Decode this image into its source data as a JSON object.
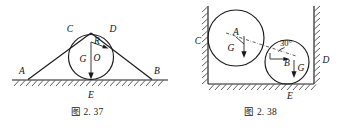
{
  "page": {
    "background_color": "#ffffff",
    "ink_color": "#1a1a1a",
    "width": 347,
    "height": 130
  },
  "figures": [
    {
      "id": "fig-2-37",
      "caption": "图 2. 37",
      "description": "Triangular wedge resting on hatched ground with a circle of radius R inscribed between the two inclined faces",
      "labels": {
        "a": "A",
        "b": "B",
        "c": "C",
        "d": "D",
        "e": "E",
        "o": "O",
        "r": "R",
        "g": "G"
      },
      "elements": {
        "ground_label": "E",
        "left_vertex_label": "A",
        "right_vertex_label": "B",
        "left_contact_label": "C",
        "right_contact_label": "D",
        "center_label": "O",
        "radius_label": "R",
        "weight_label": "G"
      }
    },
    {
      "id": "fig-2-38",
      "caption": "图 2. 38",
      "description": "Two circles A and B wedged between two vertical hatched walls and a hatched floor; the line of centers makes 30 degrees with the horizontal",
      "labels": {
        "a": "A",
        "b": "B",
        "c": "C",
        "d": "D",
        "e": "E",
        "g_upper": "G",
        "g_lower": "G",
        "angle": "30°"
      },
      "elements": {
        "upper_circle_label": "A",
        "lower_circle_label": "B",
        "left_contact_label": "C",
        "right_contact_label": "D",
        "floor_contact_label": "E",
        "upper_weight_label": "G",
        "lower_weight_label": "G",
        "angle_label": "30°"
      }
    }
  ]
}
